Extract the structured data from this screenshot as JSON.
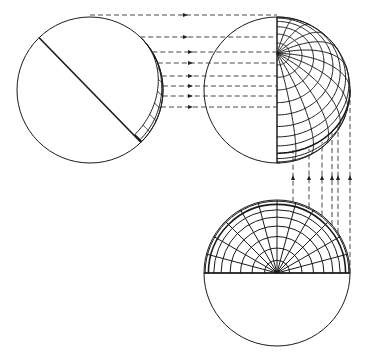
{
  "figure": {
    "colors": {
      "line": "#1a1a1a",
      "dash": "#333333",
      "background": "#ffffff"
    }
  },
  "views": {
    "left": {
      "name": "tilted-globe",
      "cx": 90,
      "cy": 90,
      "r": 73
    },
    "right": {
      "name": "side-view-globe",
      "cx": 277,
      "cy": 90,
      "r": 73
    },
    "bottom": {
      "name": "polar-view-globe",
      "cx": 277,
      "cy": 273,
      "r": 73
    }
  },
  "projection_lines": {
    "horizontal_y": [
      15,
      37,
      52,
      63,
      76,
      86,
      96,
      107
    ],
    "vertical_x": [
      293,
      309,
      322,
      332,
      338,
      350
    ]
  }
}
